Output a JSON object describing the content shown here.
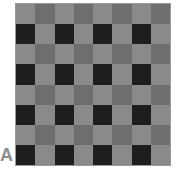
{
  "panel_label": "A",
  "grid": {
    "rows": 8,
    "cols": 8,
    "colors": {
      "light": "#8a8a8a",
      "medium": "#6e6e6e",
      "dark": "#1e1e1e"
    },
    "pattern": [
      [
        "light",
        "medium",
        "light",
        "medium",
        "light",
        "medium",
        "light",
        "medium"
      ],
      [
        "dark",
        "light",
        "dark",
        "light",
        "dark",
        "light",
        "dark",
        "light"
      ],
      [
        "light",
        "medium",
        "light",
        "medium",
        "light",
        "medium",
        "light",
        "medium"
      ],
      [
        "dark",
        "light",
        "dark",
        "light",
        "dark",
        "light",
        "dark",
        "light"
      ],
      [
        "light",
        "medium",
        "light",
        "medium",
        "light",
        "medium",
        "light",
        "medium"
      ],
      [
        "dark",
        "light",
        "dark",
        "light",
        "dark",
        "light",
        "dark",
        "light"
      ],
      [
        "light",
        "medium",
        "light",
        "medium",
        "light",
        "medium",
        "light",
        "medium"
      ],
      [
        "dark",
        "light",
        "dark",
        "light",
        "dark",
        "light",
        "dark",
        "light"
      ]
    ]
  }
}
